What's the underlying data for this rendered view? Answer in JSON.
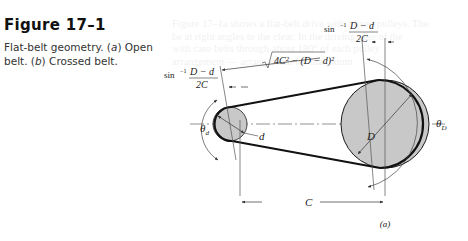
{
  "figure": {
    "number": "Figure 17–1",
    "caption_text": "Flat-belt geometry. (a) Open belt. (b) Crossed belt.",
    "caption_parts": [
      "Flat-belt geometry. (",
      "a",
      ") Open belt. (",
      "b",
      ") Crossed belt."
    ]
  },
  "diagram": {
    "labels": {
      "sin_left_prefix": "sin",
      "sin_left_exp": "−1",
      "sin_left_num": "D − d",
      "sin_left_den": "2C",
      "sin_right_prefix": "sin",
      "sin_right_exp": "−1",
      "sin_right_num": "D − d",
      "sin_right_den": "2C",
      "sqrt_expr": "4C² − (D − d)²",
      "theta_d": "θ",
      "theta_d_sub": "d",
      "theta_D": "θ",
      "theta_D_sub": "D",
      "small_d": "d",
      "large_D": "D",
      "center_dist": "C",
      "subfig": "(a)"
    },
    "colors": {
      "pulley_fill": "#c8c8c8",
      "belt": "#1a1a1a",
      "line": "#444444"
    }
  },
  "ghost_text": [
    "Figure 17–1a shows a flat-belt drive with mixed pulleys. The",
    "be at right angles to the clear. In the driving case of the",
    "with case belts through about 180° of each pulley",
    "arrangement — arrangement for maximum",
    "",
    "",
    "",
    "",
    "",
    "",
    "",
    "",
    "",
    "",
    "",
    "flexibility and ease of adjustment",
    "to take the tension check such machine",
    "belt is an advantage here",
    "power over long center distances",
    "and the ends are joined by the"
  ]
}
